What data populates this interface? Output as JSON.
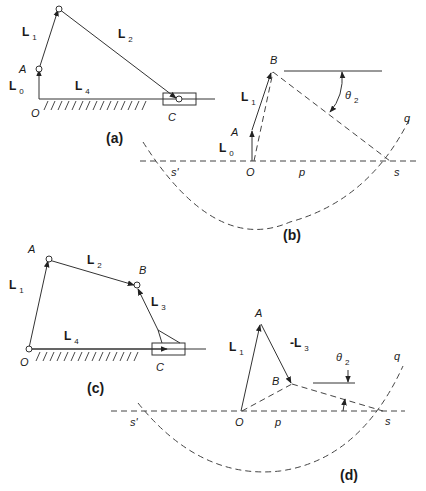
{
  "figure": {
    "panel_a": {
      "caption": "(a)",
      "points": {
        "O": "O",
        "A": "A",
        "C": "C"
      },
      "vectors": {
        "L0": {
          "main": "L",
          "sub": "0"
        },
        "L1": {
          "main": "L",
          "sub": "1"
        },
        "L2": {
          "main": "L",
          "sub": "2"
        },
        "L4": {
          "main": "L",
          "sub": "4"
        }
      }
    },
    "panel_b": {
      "caption": "(b)",
      "points": {
        "B": "B",
        "A": "A",
        "O": "O",
        "s": "s",
        "s_prime": "s'",
        "p": "p",
        "q": "q"
      },
      "vectors": {
        "L0": {
          "main": "L",
          "sub": "0"
        },
        "L1": {
          "main": "L",
          "sub": "1"
        }
      },
      "angle": {
        "main": "θ",
        "sub": "2"
      }
    },
    "panel_c": {
      "caption": "(c)",
      "points": {
        "A": "A",
        "B": "B",
        "O": "O",
        "C": "C"
      },
      "vectors": {
        "L1": {
          "main": "L",
          "sub": "1"
        },
        "L2": {
          "main": "L",
          "sub": "2"
        },
        "L3": {
          "main": "L",
          "sub": "3"
        },
        "L4": {
          "main": "L",
          "sub": "4"
        }
      }
    },
    "panel_d": {
      "caption": "(d)",
      "points": {
        "A": "A",
        "B": "B",
        "O": "O",
        "s": "s",
        "s_prime": "s'",
        "p": "p",
        "q": "q"
      },
      "vectors": {
        "L1": {
          "main": "L",
          "sub": "1"
        },
        "negL3": {
          "main": "-L",
          "sub": "3"
        }
      },
      "angle": {
        "main": "θ",
        "sub": "2"
      }
    }
  },
  "colors": {
    "ink": "#333333",
    "background": "#ffffff"
  }
}
